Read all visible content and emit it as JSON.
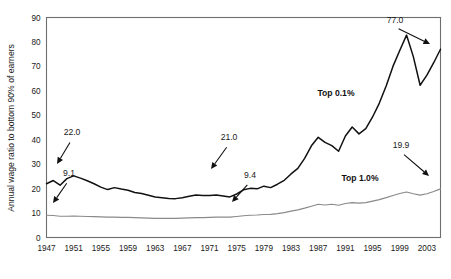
{
  "chart_data": {
    "type": "line",
    "title": "",
    "xlabel": "",
    "ylabel": "Annual wage ratio to bottom 90% of earners",
    "ylim": [
      0,
      90
    ],
    "xlim": [
      1947,
      2005
    ],
    "ytick_labels": [
      "0",
      "10",
      "20",
      "30",
      "40",
      "50",
      "60",
      "70",
      "80",
      "90"
    ],
    "yticks": [
      0,
      10,
      20,
      30,
      40,
      50,
      60,
      70,
      80,
      90
    ],
    "xtick_labels": [
      "1947",
      "1951",
      "1955",
      "1959",
      "1963",
      "1967",
      "1971",
      "1975",
      "1979",
      "1983",
      "1987",
      "1991",
      "1995",
      "1999",
      "2003"
    ],
    "xticks": [
      1947,
      1951,
      1955,
      1959,
      1963,
      1967,
      1971,
      1975,
      1979,
      1983,
      1987,
      1991,
      1995,
      1999,
      2003
    ],
    "grid": false,
    "legend_position": "inline-labels",
    "x": [
      1947,
      1948,
      1949,
      1950,
      1951,
      1952,
      1953,
      1954,
      1955,
      1956,
      1957,
      1958,
      1959,
      1960,
      1961,
      1962,
      1963,
      1964,
      1965,
      1966,
      1967,
      1968,
      1969,
      1970,
      1971,
      1972,
      1973,
      1974,
      1975,
      1976,
      1977,
      1978,
      1979,
      1980,
      1981,
      1982,
      1983,
      1984,
      1985,
      1986,
      1987,
      1988,
      1989,
      1990,
      1991,
      1992,
      1993,
      1994,
      1995,
      1996,
      1997,
      1998,
      1999,
      2000,
      2001,
      2002,
      2003,
      2004,
      2005
    ],
    "series": [
      {
        "name": "Top 0.1%",
        "color": "#111111",
        "values": [
          22.0,
          23.3,
          21.4,
          24.1,
          25.2,
          24.3,
          23.2,
          22.0,
          20.6,
          19.6,
          20.4,
          19.8,
          19.3,
          18.4,
          18.0,
          17.3,
          16.6,
          16.3,
          16.0,
          15.9,
          16.3,
          16.9,
          17.4,
          17.2,
          17.2,
          17.4,
          17.0,
          16.6,
          17.8,
          19.5,
          20.1,
          19.9,
          21.0,
          20.4,
          21.8,
          23.4,
          26.0,
          28.3,
          32.4,
          37.5,
          41.0,
          38.9,
          37.6,
          35.3,
          41.5,
          45.2,
          42.4,
          44.5,
          49.3,
          55.0,
          62.0,
          70.0,
          76.5,
          82.8,
          74.0,
          62.3,
          66.4,
          71.5,
          77.0
        ]
      },
      {
        "name": "Top 1.0%",
        "color": "#8a8a8a",
        "values": [
          9.1,
          9.0,
          8.7,
          8.7,
          8.8,
          8.7,
          8.6,
          8.5,
          8.4,
          8.3,
          8.3,
          8.2,
          8.2,
          8.1,
          8.0,
          7.9,
          7.8,
          7.8,
          7.8,
          7.8,
          7.9,
          8.0,
          8.1,
          8.1,
          8.2,
          8.3,
          8.3,
          8.3,
          8.6,
          8.9,
          9.1,
          9.2,
          9.4,
          9.5,
          9.8,
          10.2,
          10.8,
          11.3,
          12.0,
          12.8,
          13.6,
          13.3,
          13.6,
          13.2,
          13.9,
          14.3,
          14.1,
          14.3,
          14.9,
          15.5,
          16.3,
          17.2,
          18.0,
          18.6,
          17.9,
          17.3,
          17.9,
          18.8,
          19.9
        ]
      }
    ],
    "annotations": [
      {
        "text": "22.0",
        "value": 22.0,
        "year": 1947,
        "label_x": 72,
        "label_y": 135,
        "tip_x": 57,
        "tip_y": 164
      },
      {
        "text": "9.1",
        "value": 9.1,
        "year": 1947,
        "label_x": 69,
        "label_y": 176,
        "tip_x": 53,
        "tip_y": 203
      },
      {
        "text": "21.0",
        "value": 21.0,
        "year": 1979,
        "label_x": 229,
        "label_y": 140,
        "tip_x": 211,
        "tip_y": 169
      },
      {
        "text": "9.4",
        "value": 9.4,
        "year": 1979,
        "label_x": 250,
        "label_y": 178,
        "tip_x": 232,
        "tip_y": 202
      },
      {
        "text": "77.0",
        "value": 77.0,
        "year": 2005,
        "label_x": 395,
        "label_y": 23,
        "tip_x": 430,
        "tip_y": 44
      },
      {
        "text": "19.9",
        "value": 19.9,
        "year": 2005,
        "label_x": 401,
        "label_y": 148,
        "tip_x": 429,
        "tip_y": 176
      }
    ],
    "series_labels": [
      {
        "text": "Top 0.1%",
        "x": 336,
        "y": 96
      },
      {
        "text": "Top 1.0%",
        "x": 360,
        "y": 181
      }
    ]
  }
}
